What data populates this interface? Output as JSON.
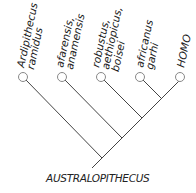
{
  "diagram": {
    "type": "cladogram",
    "root_label": "AUSTRALOPITHECUS",
    "taxa": [
      {
        "lines": [
          "Ardipithecus",
          "ramidus"
        ]
      },
      {
        "lines": [
          "afarensis,",
          "anamensis"
        ]
      },
      {
        "lines": [
          "robustus,",
          "aethiopicus,",
          "boisei"
        ]
      },
      {
        "lines": [
          "africanus",
          "garhi"
        ]
      },
      {
        "lines": [
          "HOMO"
        ]
      }
    ],
    "colors": {
      "line": "#444444",
      "node_fill": "#ffffff",
      "node_stroke": "#888888",
      "text": "#222222"
    }
  }
}
